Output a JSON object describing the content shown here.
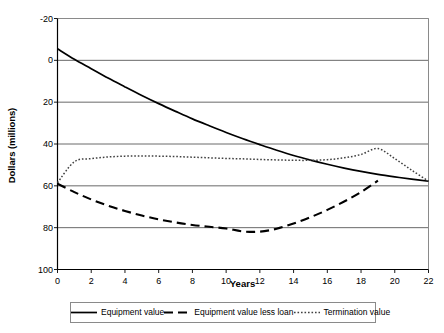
{
  "chart_data": {
    "type": "line",
    "title": "",
    "xlabel": "Years",
    "ylabel": "Dollars (millions)",
    "xlim": [
      0,
      22
    ],
    "ylim": [
      -20,
      100
    ],
    "xticks": [
      0,
      2,
      4,
      6,
      8,
      10,
      12,
      14,
      16,
      18,
      20,
      22
    ],
    "yticks": [
      -20,
      0,
      20,
      40,
      60,
      80,
      100
    ],
    "grid": "horizontal",
    "legend_position": "bottom",
    "x": [
      0,
      1,
      2,
      3,
      4,
      5,
      6,
      7,
      8,
      9,
      10,
      11,
      12,
      13,
      14,
      15,
      16,
      17,
      18,
      19,
      20,
      21,
      22
    ],
    "series": [
      {
        "name": "Equipment value",
        "style": "solid",
        "color": "#000000",
        "values": [
          85.5,
          80.5,
          76.0,
          71.5,
          67.3,
          63.2,
          59.3,
          55.6,
          52.0,
          48.7,
          45.5,
          42.5,
          39.7,
          37.0,
          34.5,
          32.3,
          30.3,
          28.5,
          26.9,
          25.5,
          24.3,
          23.2,
          22.2
        ]
      },
      {
        "name": "Equipment value less loan",
        "style": "dashed",
        "color": "#000000",
        "values": [
          21.0,
          17.0,
          13.5,
          10.5,
          8.0,
          5.8,
          4.0,
          2.5,
          1.3,
          0.4,
          -0.4,
          -1.8,
          -1.9,
          -0.5,
          2.0,
          5.0,
          8.5,
          12.5,
          17.0,
          22.5,
          null,
          null,
          null
        ]
      },
      {
        "name": "Termination value",
        "style": "dotted",
        "color": "#404040",
        "values": [
          21.5,
          31.5,
          33.0,
          33.8,
          34.2,
          34.3,
          34.2,
          34.0,
          33.7,
          33.4,
          33.1,
          32.9,
          32.6,
          32.4,
          32.2,
          32.2,
          32.5,
          33.4,
          35.0,
          37.8,
          33.0,
          27.5,
          22.2
        ]
      }
    ]
  },
  "axes": {
    "y_title": "Dollars (millions)",
    "x_title": "Years",
    "y_tick_labels": [
      "100",
      "80",
      "60",
      "40",
      "20",
      "0",
      "-20"
    ],
    "x_tick_labels": [
      "0",
      "2",
      "4",
      "6",
      "8",
      "10",
      "12",
      "14",
      "16",
      "18",
      "20",
      "22"
    ]
  },
  "legend": {
    "items": [
      {
        "label": "Equipment value",
        "style": "solid"
      },
      {
        "label": "Equipment value less loan",
        "style": "dashed"
      },
      {
        "label": "Termination value",
        "style": "dotted"
      }
    ]
  },
  "colors": {
    "axis": "#000000",
    "grid": "#595959",
    "frame": "#8a8a8a",
    "series_solid": "#000000",
    "series_dashed": "#000000",
    "series_dotted": "#404040"
  }
}
